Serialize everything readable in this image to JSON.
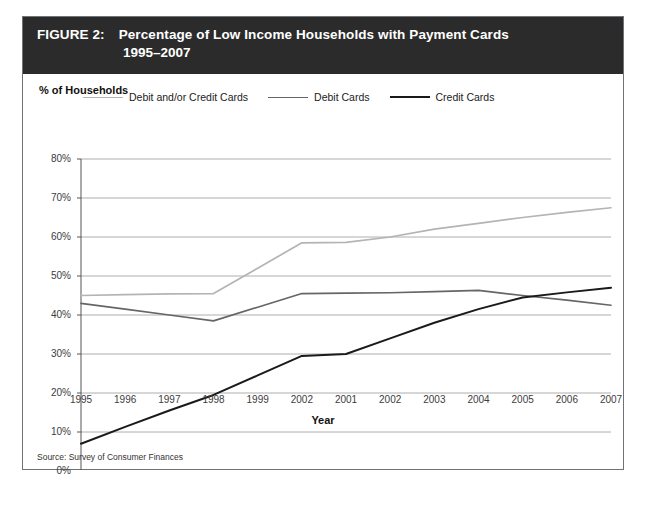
{
  "figure": {
    "label": "FIGURE 2:",
    "title_line1": "Percentage of Low Income Households with Payment Cards",
    "title_line2": "1995–2007",
    "source": "Source: Survey of Consumer Finances"
  },
  "colors": {
    "header_background": "#2b2b2b",
    "header_text": "#ffffff",
    "frame_border": "#6f7276",
    "gridline": "#9a9a9a",
    "axis": "#555555",
    "series_debit_and_or_credit": "#b4b4b4",
    "series_debit": "#666666",
    "series_credit": "#1a1a1a",
    "plot_background": "#ffffff"
  },
  "chart_data": {
    "type": "line",
    "title": "Percentage of Low Income Households with Payment Cards 1995–2007",
    "xlabel": "Year",
    "ylabel": "% of Households",
    "ylim": [
      0,
      80
    ],
    "ytick_labels": [
      "0%",
      "10%",
      "20%",
      "30%",
      "40%",
      "50%",
      "60%",
      "70%",
      "80%"
    ],
    "ytick_values": [
      0,
      10,
      20,
      30,
      40,
      50,
      60,
      70,
      80
    ],
    "grid": true,
    "legend_position": "top-left-inside",
    "categories": [
      "1995",
      "1996",
      "1997",
      "1998",
      "1999",
      "2002",
      "2001",
      "2002",
      "2003",
      "2004",
      "2005",
      "2006",
      "2007"
    ],
    "series": [
      {
        "name": "Debit and/or Credit Cards",
        "color": "#b4b4b4",
        "values": [
          45.0,
          45.2,
          45.4,
          45.5,
          52.0,
          58.5,
          58.6,
          60.0,
          62.0,
          63.5,
          65.0,
          66.3,
          67.5
        ]
      },
      {
        "name": "Debit Cards",
        "color": "#666666",
        "values": [
          43.0,
          41.5,
          40.0,
          38.5,
          42.0,
          45.5,
          45.6,
          45.7,
          46.0,
          46.3,
          45.0,
          43.8,
          42.5
        ]
      },
      {
        "name": "Credit Cards",
        "color": "#1a1a1a",
        "values": [
          7.0,
          11.3,
          15.5,
          19.5,
          24.5,
          29.5,
          30.0,
          34.0,
          38.0,
          41.5,
          44.5,
          45.8,
          47.0
        ]
      }
    ]
  }
}
